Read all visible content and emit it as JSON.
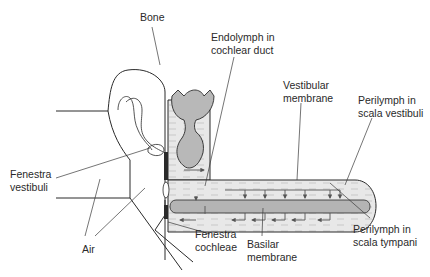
{
  "diagram": {
    "type": "anatomical-schematic",
    "colors": {
      "fluid_fill": "#e6e6e6",
      "membrane_fill": "#b4b4b4",
      "duct_fill": "#b9b9b9",
      "outline": "#2a2a2a",
      "arrow": "#555555",
      "background": "#ffffff"
    },
    "labels": {
      "bone": "Bone",
      "endolymph": "Endolymph in\ncochlear duct",
      "vestibular_membrane": "Vestibular\nmembrane",
      "perilymph_vestibuli": "Perilymph in\nscala vestibuli",
      "fenestra_vestibuli": "Fenestra\nvestibuli",
      "air": "Air",
      "fenestra_cochleae": "Fenestra\ncochleae",
      "basilar_membrane": "Basilar\nmembrane",
      "perilymph_tympani": "Perilymph in\nscala tympani"
    }
  }
}
